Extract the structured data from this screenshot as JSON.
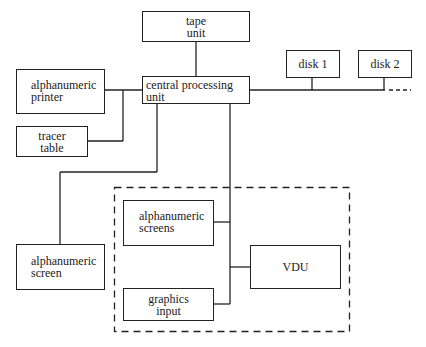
{
  "diagram": {
    "nodes": {
      "tape_unit": "tape\nunit",
      "cpu": "central processing\nunit",
      "alpha_printer": "alphanumeric\nprinter",
      "tracer_table": "tracer\ntable",
      "disk1": "disk 1",
      "disk2": "disk 2",
      "alpha_screen": "alphanumeric\nscreen",
      "alpha_screens": "alphanumeric\nscreens",
      "graphics_input": "graphics\ninput",
      "vdu": "VDU"
    },
    "edges": [
      [
        "tape_unit",
        "cpu"
      ],
      [
        "cpu",
        "alpha_printer"
      ],
      [
        "cpu",
        "tracer_table"
      ],
      [
        "cpu",
        "disk1"
      ],
      [
        "cpu",
        "disk2"
      ],
      [
        "cpu",
        "alpha_screen"
      ],
      [
        "cpu",
        "alpha_screens"
      ],
      [
        "cpu",
        "vdu"
      ],
      [
        "cpu",
        "graphics_input"
      ]
    ],
    "groups": [
      {
        "name": "workstation-group",
        "style": "dashed",
        "members": [
          "alpha_screens",
          "vdu",
          "graphics_input"
        ]
      }
    ],
    "line_color": "#222222"
  }
}
